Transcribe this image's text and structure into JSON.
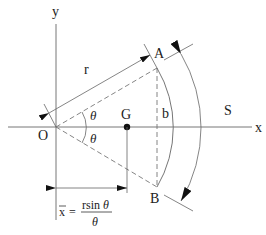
{
  "diagram": {
    "axes": {
      "x_label": "x",
      "y_label": "y"
    },
    "points": {
      "origin": "O",
      "top": "A",
      "bottom": "B",
      "centroid": "G"
    },
    "labels": {
      "radius": "r",
      "chord": "b",
      "arc_length": "S",
      "half_angle_upper": "θ",
      "half_angle_lower": "θ"
    },
    "formula": {
      "lhs": "x",
      "equals": "=",
      "numerator_r": "rsin ",
      "numerator_theta": "θ",
      "denominator": "θ"
    },
    "colors": {
      "line": "#555555",
      "text": "#222222",
      "background": "#ffffff"
    }
  }
}
